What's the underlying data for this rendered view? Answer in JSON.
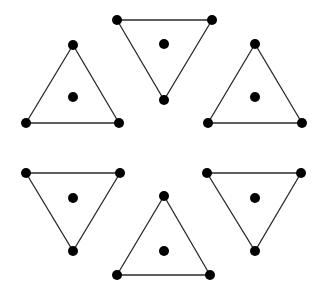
{
  "diagram": {
    "colors": {
      "background": "#ffffff",
      "stroke": "#2a2a2a",
      "dot": "#000000"
    },
    "vertex_radius": 5,
    "center_radius": 5,
    "triangles": [
      {
        "id": "top",
        "orientation": "down",
        "vertices": [
          [
            117,
            20
          ],
          [
            212,
            20
          ],
          [
            164,
            100
          ]
        ],
        "center": [
          164,
          44
        ]
      },
      {
        "id": "upper-left",
        "orientation": "up",
        "vertices": [
          [
            73,
            45
          ],
          [
            26,
            123
          ],
          [
            119,
            123
          ]
        ],
        "center": [
          73,
          97
        ]
      },
      {
        "id": "upper-right",
        "orientation": "up",
        "vertices": [
          [
            255,
            44
          ],
          [
            208,
            123
          ],
          [
            302,
            123
          ]
        ],
        "center": [
          255,
          97
        ]
      },
      {
        "id": "lower-left",
        "orientation": "down",
        "vertices": [
          [
            26,
            173
          ],
          [
            120,
            173
          ],
          [
            73,
            251
          ]
        ],
        "center": [
          73,
          198
        ]
      },
      {
        "id": "bottom",
        "orientation": "up",
        "vertices": [
          [
            164,
            196
          ],
          [
            117,
            275
          ],
          [
            210,
            275
          ]
        ],
        "center": [
          164,
          251
        ]
      },
      {
        "id": "lower-right",
        "orientation": "down",
        "vertices": [
          [
            207,
            173
          ],
          [
            301,
            173
          ],
          [
            255,
            251
          ]
        ],
        "center": [
          255,
          198
        ]
      }
    ]
  }
}
